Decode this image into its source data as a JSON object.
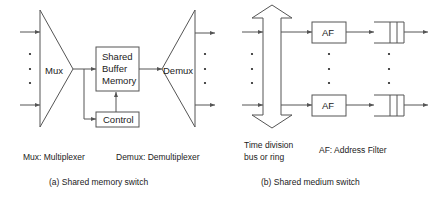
{
  "diagram_a": {
    "mux_label": "Mux",
    "buffer_label_lines": [
      "Shared",
      "Buffer",
      "Memory"
    ],
    "control_label": "Control",
    "demux_label": "Demux",
    "legend_mux": "Mux: Multiplexer",
    "legend_demux": "Demux: Demultiplexer",
    "caption": "(a) Shared memory switch"
  },
  "diagram_b": {
    "af_label_top": "AF",
    "af_label_bottom": "AF",
    "bus_label_lines": [
      "Time division",
      "bus or ring"
    ],
    "legend_af": "AF: Address Filter",
    "caption": "(b) Shared medium switch"
  },
  "colors": {
    "stroke": "#555555",
    "text": "#222222",
    "background": "#ffffff"
  }
}
